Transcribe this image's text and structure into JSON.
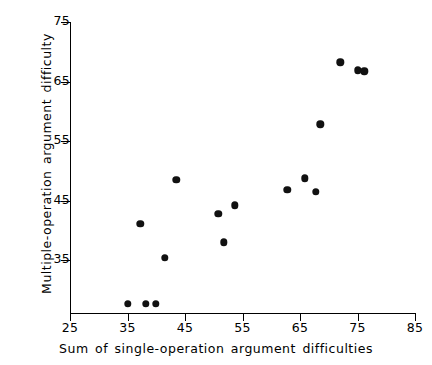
{
  "chart_data": {
    "type": "scatter",
    "title": "",
    "xlabel": "Sum of single-operation argument difficulties",
    "ylabel": "Multiple-operation argument difficulty",
    "xlim": [
      25,
      85
    ],
    "ylim": [
      26,
      75
    ],
    "xticks": [
      25,
      35,
      45,
      55,
      65,
      75,
      85
    ],
    "yticks": [
      35,
      45,
      55,
      65,
      75
    ],
    "xtick_labels": [
      "25",
      "35",
      "45",
      "55",
      "65",
      "75",
      "85"
    ],
    "ytick_labels": [
      "35",
      "45",
      "55",
      "65",
      "75"
    ],
    "grid": false,
    "legend": false,
    "marker": "filled-circle",
    "marker_color": "#111111",
    "points": [
      {
        "x": 35.0,
        "y": 27.6
      },
      {
        "x": 38.2,
        "y": 27.6
      },
      {
        "x": 39.9,
        "y": 27.6
      },
      {
        "x": 37.2,
        "y": 41.1
      },
      {
        "x": 41.5,
        "y": 35.4
      },
      {
        "x": 43.5,
        "y": 48.5
      },
      {
        "x": 50.8,
        "y": 42.8
      },
      {
        "x": 51.7,
        "y": 38.0
      },
      {
        "x": 53.7,
        "y": 44.2
      },
      {
        "x": 62.8,
        "y": 46.8
      },
      {
        "x": 65.8,
        "y": 48.7
      },
      {
        "x": 67.7,
        "y": 46.5
      },
      {
        "x": 68.5,
        "y": 57.8
      },
      {
        "x": 72.0,
        "y": 68.2
      },
      {
        "x": 75.0,
        "y": 66.9
      },
      {
        "x": 76.2,
        "y": 66.7
      }
    ]
  }
}
